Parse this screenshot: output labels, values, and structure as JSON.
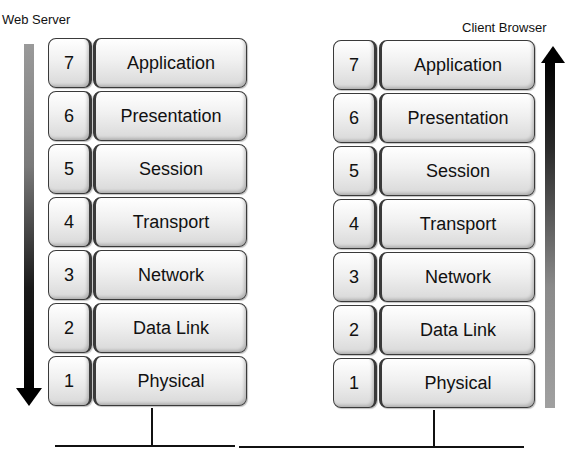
{
  "left_stack": {
    "title": "Web Server",
    "direction": "down",
    "layers": [
      {
        "number": "7",
        "name": "Application"
      },
      {
        "number": "6",
        "name": "Presentation"
      },
      {
        "number": "5",
        "name": "Session"
      },
      {
        "number": "4",
        "name": "Transport"
      },
      {
        "number": "3",
        "name": "Network"
      },
      {
        "number": "2",
        "name": "Data Link"
      },
      {
        "number": "1",
        "name": "Physical"
      }
    ]
  },
  "right_stack": {
    "title": "Client Browser",
    "direction": "up",
    "layers": [
      {
        "number": "7",
        "name": "Application"
      },
      {
        "number": "6",
        "name": "Presentation"
      },
      {
        "number": "5",
        "name": "Session"
      },
      {
        "number": "4",
        "name": "Transport"
      },
      {
        "number": "3",
        "name": "Network"
      },
      {
        "number": "2",
        "name": "Data Link"
      },
      {
        "number": "1",
        "name": "Physical"
      }
    ]
  },
  "colors": {
    "arrow_dark": "#000000",
    "arrow_light": "#9a9a9a",
    "box_border": "#3a3a3a"
  }
}
